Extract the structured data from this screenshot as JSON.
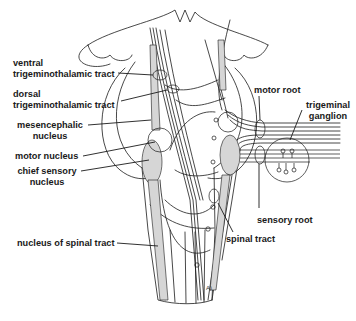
{
  "diagram": {
    "colors": {
      "line": "#1a1a1a",
      "shade": "#d6d6d6",
      "background": "#ffffff"
    },
    "labels": {
      "ventral_tt": [
        "ventral",
        "trigeminothalamic tract"
      ],
      "dorsal_tt": [
        "dorsal",
        "trigeminothalamic tract"
      ],
      "mesencephalic": [
        "mesencephalic",
        "nucleus"
      ],
      "motor_nucleus": "motor nucleus",
      "chief_sensory": [
        "chief sensory",
        "nucleus"
      ],
      "spinal_nucleus": "nucleus of spinal tract",
      "motor_root": "motor root",
      "ganglion": [
        "trigeminal",
        "ganglion"
      ],
      "sensory_root": "sensory root",
      "spinal_tract": "spinal tract",
      "corner_mark": "A)"
    }
  }
}
